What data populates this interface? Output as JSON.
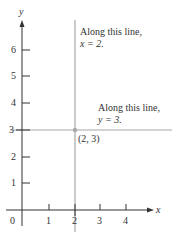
{
  "axes": {
    "x_label": "x",
    "y_label": "y",
    "origin_label": "0",
    "x_ticks": [
      "1",
      "2",
      "3",
      "4"
    ],
    "y_ticks": [
      "1",
      "2",
      "3",
      "4",
      "5",
      "6"
    ]
  },
  "vertical_line": {
    "annotation_line1": "Along this line,",
    "annotation_line2": "x = 2.",
    "x_value": 2,
    "color": "#a8a8a8"
  },
  "horizontal_line": {
    "annotation_line1": "Along this line,",
    "annotation_line2": "y = 3.",
    "y_value": 3,
    "color": "#a8a8a8"
  },
  "point": {
    "label": "(2, 3)",
    "color": "#a8a8a8"
  },
  "axis_color": "#333333"
}
